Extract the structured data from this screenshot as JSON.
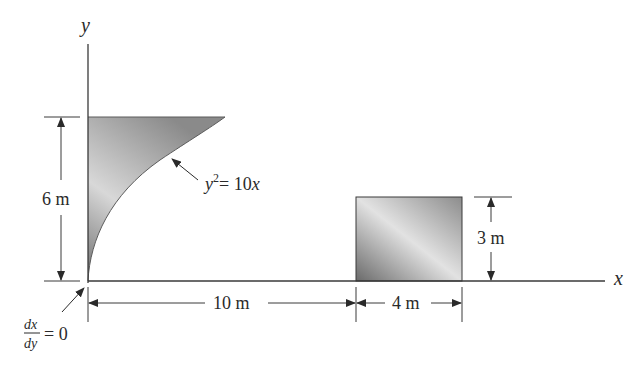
{
  "axes": {
    "x_label": "x",
    "y_label": "y"
  },
  "curve": {
    "equation_lhs": "y",
    "equation_exp": "2",
    "equation_rhs": "= 10",
    "equation_var": "x"
  },
  "dimensions": {
    "height_left": "6 m",
    "distance": "10 m",
    "width_rect": "4 m",
    "height_rect": "3 m"
  },
  "slope_note": {
    "numerator": "dx",
    "denominator": "dy",
    "value": "= 0"
  },
  "colors": {
    "line": "#3a3a3a",
    "shade_dark": "#6e6e6e",
    "shade_light": "#dcdcdc"
  }
}
